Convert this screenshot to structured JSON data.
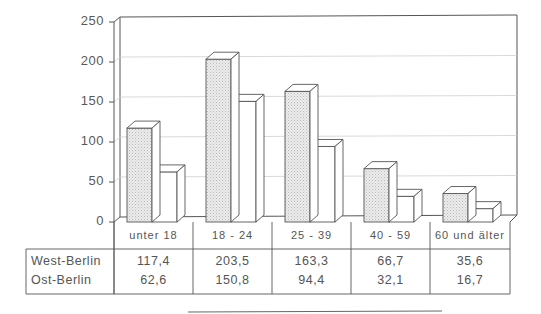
{
  "chart_data": {
    "type": "bar",
    "style": "3d-grouped-bar-with-data-table",
    "title": "",
    "xlabel": "",
    "ylabel": "",
    "ylim": [
      0,
      250
    ],
    "yticks": [
      0,
      50,
      100,
      150,
      200,
      250
    ],
    "grid": true,
    "legend_position": "data-table-below",
    "categories": [
      "unter 18",
      "18 - 24",
      "25 - 39",
      "40 - 59",
      "60 und älter"
    ],
    "series": [
      {
        "name": "West-Berlin",
        "values": [
          117.4,
          203.5,
          163.3,
          66.7,
          35.6
        ],
        "fill": "#e4e4e4",
        "pattern": "dotted"
      },
      {
        "name": "Ost-Berlin",
        "values": [
          62.6,
          150.8,
          94.4,
          32.1,
          16.7
        ],
        "fill": "#ffffff",
        "pattern": "none"
      }
    ]
  },
  "yaxis": {
    "tick_labels": [
      "250",
      "200",
      "150",
      "100",
      "50",
      "0"
    ]
  },
  "table": {
    "categories": [
      "unter 18",
      "18 - 24",
      "25 - 39",
      "40 - 59",
      "60 und älter"
    ],
    "rows": [
      {
        "label": "West-Berlin",
        "values": [
          "117,4",
          "203,5",
          "163,3",
          "66,7",
          "35,6"
        ]
      },
      {
        "label": "Ost-Berlin",
        "values": [
          "62,6",
          "150,8",
          "94,4",
          "32,1",
          "16,7"
        ]
      }
    ]
  },
  "colors": {
    "line": "#555555",
    "grid": "#cfcfcf",
    "west_fill": "#e2e2e2",
    "ost_fill": "#ffffff",
    "side_fill": "#ffffff"
  }
}
